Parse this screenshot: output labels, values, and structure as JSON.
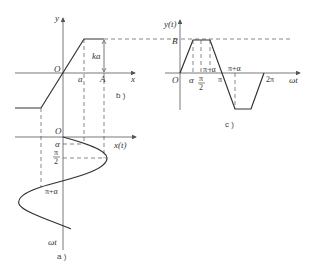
{
  "figure_b": {
    "caption": "b )",
    "y_axis_label": "y",
    "x_axis_label": "x",
    "origin_label": "O",
    "knee_label": "a",
    "input_amplitude_label": "A",
    "saturation_label": "ka"
  },
  "figure_a": {
    "caption": "a )",
    "x_axis_label": "x(t)",
    "time_axis_label": "ωt",
    "origin_label": "O",
    "alpha_label": "α",
    "half_pi_num": "π",
    "half_pi_den": "2",
    "pi_plus_alpha_label": "π+α"
  },
  "figure_c": {
    "caption": "c )",
    "y_axis_label": "y(t)",
    "x_axis_label": "ωt",
    "origin_label": "O",
    "amplitude_label": "B",
    "alpha_label": "α",
    "half_pi_num": "π",
    "half_pi_den": "2",
    "pi_minus_alpha_label": "π−α",
    "pi_label": "π",
    "pi_plus_alpha_label": "π+α",
    "two_pi_label": "2π"
  }
}
